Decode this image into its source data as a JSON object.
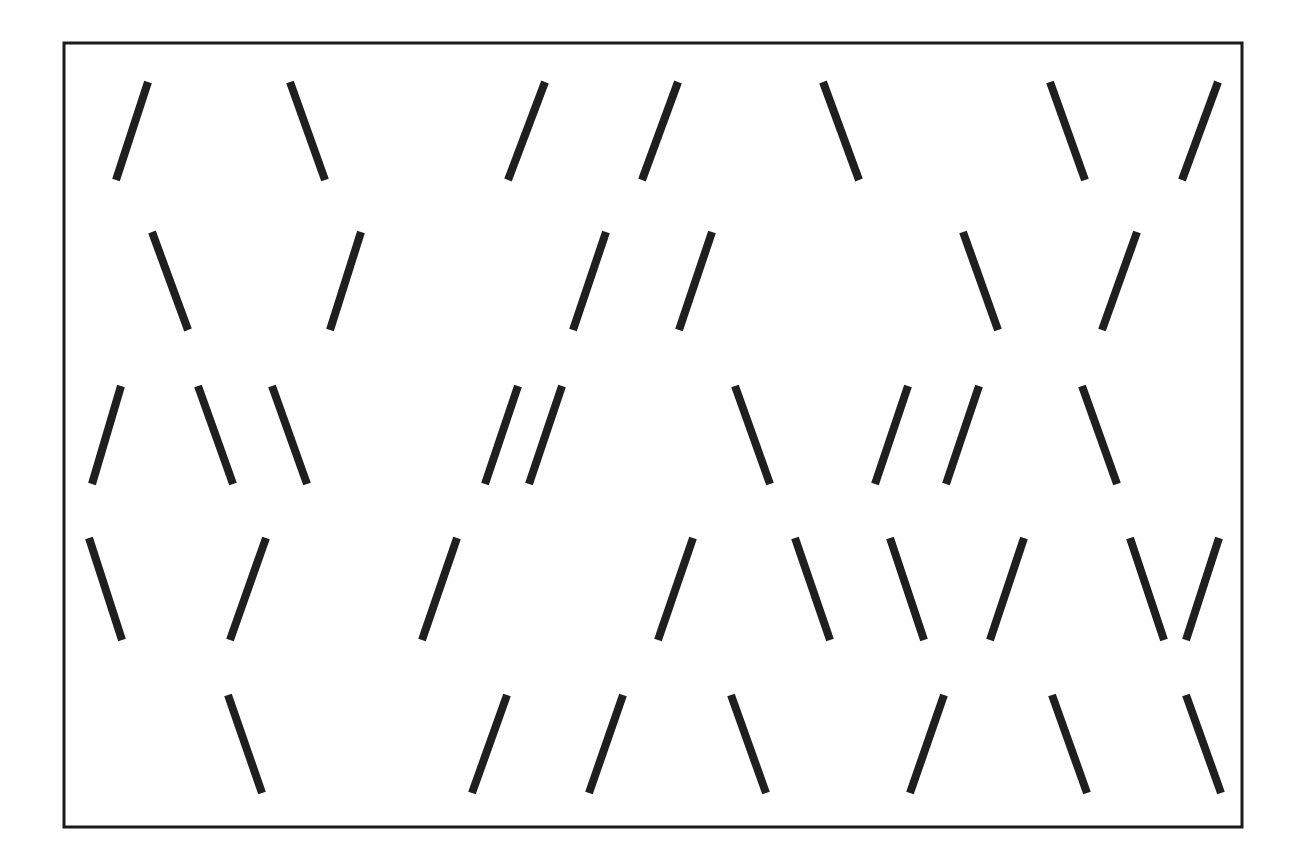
{
  "figure": {
    "type": "line-orientation-array",
    "canvas": {
      "width": 1298,
      "height": 862,
      "background": "#ffffff"
    },
    "frame": {
      "name": "outer-border",
      "x": 64,
      "y": 43,
      "width": 1178,
      "height": 784,
      "stroke_color": "#1a1a1a",
      "stroke_width": 3
    },
    "stimulus": {
      "stroke_color": "#1f1f1f",
      "stroke_width": 8,
      "nominal_length": 100,
      "tilt_left_degrees": -18,
      "tilt_right_degrees": 19,
      "row_count": 5,
      "total_lines": 38,
      "left_tilt_count": 19,
      "right_tilt_count": 19
    }
  },
  "chart_data": {
    "type": "scatter",
    "title": "",
    "subtitle": "",
    "xlabel": "",
    "ylabel": "",
    "xlim": [
      64,
      1242
    ],
    "ylim": [
      43,
      827
    ],
    "grid": false,
    "legend": null,
    "annotations": [],
    "row_labels": [
      "row-1",
      "row-2",
      "row-3",
      "row-4",
      "row-5"
    ],
    "orientation_codes": {
      "left": "/",
      "right": "\\"
    },
    "rows": [
      {
        "row": 1,
        "y_top": 82,
        "y_bottom": 180,
        "count": 7,
        "orientations": [
          "/",
          "\\",
          "/",
          "/",
          "\\",
          "\\",
          "/"
        ],
        "x_tops": [
          148,
          290,
          545,
          678,
          823,
          1050,
          1218
        ],
        "x_bottoms": [
          116,
          325,
          508,
          642,
          859,
          1085,
          1182
        ]
      },
      {
        "row": 2,
        "y_top": 232,
        "y_bottom": 330,
        "count": 6,
        "orientations": [
          "\\",
          "/",
          "/",
          "/",
          "\\",
          "/"
        ],
        "x_tops": [
          152,
          361,
          606,
          712,
          963,
          1137
        ],
        "x_bottoms": [
          188,
          330,
          573,
          679,
          998,
          1102
        ]
      },
      {
        "row": 3,
        "y_top": 386,
        "y_bottom": 484,
        "count": 9,
        "orientations": [
          "/",
          "\\",
          "\\",
          "/",
          "/",
          "\\",
          "/",
          "/",
          "\\"
        ],
        "x_tops": [
          121,
          198,
          272,
          518,
          562,
          735,
          908,
          979,
          1082
        ],
        "x_bottoms": [
          92,
          233,
          307,
          485,
          529,
          770,
          875,
          946,
          1117
        ]
      },
      {
        "row": 4,
        "y_top": 538,
        "y_bottom": 640,
        "count": 9,
        "orientations": [
          "\\",
          "/",
          "/",
          "/",
          "\\",
          "\\",
          "/",
          "\\",
          "/"
        ],
        "x_tops": [
          89,
          266,
          457,
          693,
          795,
          890,
          1024,
          1130,
          1219
        ],
        "x_bottoms": [
          122,
          230,
          422,
          658,
          830,
          924,
          990,
          1164,
          1186
        ]
      },
      {
        "row": 5,
        "y_top": 695,
        "y_bottom": 793,
        "count": 7,
        "orientations": [
          "\\",
          "/",
          "/",
          "\\",
          "/",
          "\\",
          "\\"
        ],
        "x_tops": [
          228,
          507,
          623,
          731,
          944,
          1052,
          1186
        ],
        "x_bottoms": [
          262,
          472,
          589,
          766,
          910,
          1087,
          1221
        ]
      }
    ]
  }
}
